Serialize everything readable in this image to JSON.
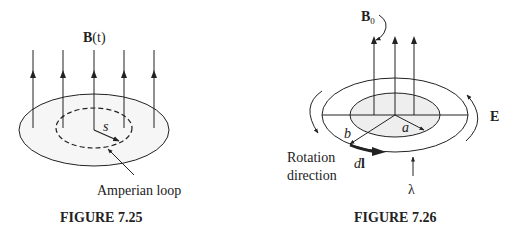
{
  "figures": [
    {
      "id": "fig-7-25",
      "caption": "FIGURE 7.25",
      "field_label_bold": "B",
      "field_label_arg": "(t)",
      "radius_label": "s",
      "loop_label": "Amperian loop",
      "field_lines": 5
    },
    {
      "id": "fig-7-26",
      "caption": "FIGURE 7.26",
      "field_label_bold": "B",
      "field_label_sub": "0",
      "inner_radius_label": "a",
      "outer_radius_label": "b",
      "efield_label": "E",
      "line_element_italic": "d",
      "line_element_bold": "l",
      "charge_density_label": "λ",
      "rotation_label_line1": "Rotation",
      "rotation_label_line2": "direction",
      "field_lines": 3
    }
  ],
  "colors": {
    "ink": "#222222",
    "shade": "#eeeeee",
    "background": "#ffffff"
  }
}
